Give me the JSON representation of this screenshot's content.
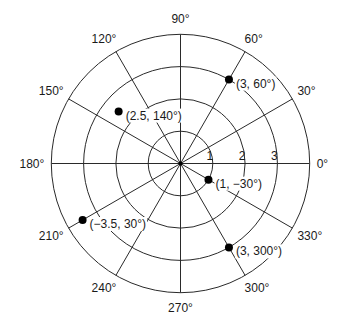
{
  "diagram": {
    "title": "",
    "type": "polar-coordinate-grid",
    "ring_labels": [
      "1",
      "2",
      "3"
    ],
    "rings": [
      1,
      2,
      3,
      4
    ],
    "angle_step_deg": 30,
    "angle_labels": [
      {
        "deg": 0,
        "text": "0°"
      },
      {
        "deg": 30,
        "text": "30°"
      },
      {
        "deg": 60,
        "text": "60°"
      },
      {
        "deg": 90,
        "text": "90°"
      },
      {
        "deg": 120,
        "text": "120°"
      },
      {
        "deg": 150,
        "text": "150°"
      },
      {
        "deg": 180,
        "text": "180°"
      },
      {
        "deg": 210,
        "text": "210°"
      },
      {
        "deg": 240,
        "text": "240°"
      },
      {
        "deg": 270,
        "text": "270°"
      },
      {
        "deg": 300,
        "text": "300°"
      },
      {
        "deg": 330,
        "text": "330°"
      }
    ],
    "points": [
      {
        "r": 3,
        "theta": 60,
        "label": "(3, 60°)"
      },
      {
        "r": 2.5,
        "theta": 140,
        "label": "(2.5, 140°)"
      },
      {
        "r": 1,
        "theta": -30,
        "label": "(1, −30°)"
      },
      {
        "r": -3.5,
        "theta": 30,
        "label": "(−3.5, 30°)"
      },
      {
        "r": 3,
        "theta": 300,
        "label": "(3, 300°)"
      }
    ],
    "colors": {
      "line": "#2a2a2a",
      "point": "#000000",
      "background": "#ffffff"
    }
  }
}
